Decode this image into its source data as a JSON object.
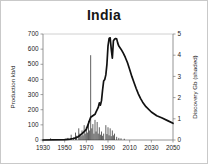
{
  "chart_data": {
    "type": "line",
    "title": "India",
    "xlabel": "",
    "ylabel": "Production kb/d",
    "y2label": "Discovery Gb (shaded)",
    "xlim": [
      1930,
      2050
    ],
    "ylim": [
      0,
      700
    ],
    "y2lim": [
      0,
      5
    ],
    "xticks": [
      1930,
      1950,
      1970,
      1990,
      2010,
      2030,
      2050
    ],
    "yticks": [
      0,
      100,
      200,
      300,
      400,
      500,
      600,
      700
    ],
    "y2ticks": [
      0,
      1,
      2,
      3,
      4,
      5
    ],
    "grid": false,
    "legend": "none",
    "series": [
      {
        "name": "Production kb/d",
        "axis": "left",
        "units": "kb/d",
        "x": [
          1930,
          1950,
          1955,
          1958,
          1960,
          1962,
          1964,
          1966,
          1968,
          1970,
          1972,
          1974,
          1976,
          1978,
          1979,
          1980,
          1981,
          1982,
          1983,
          1984,
          1985,
          1986,
          1987,
          1988,
          1989,
          1990,
          1991,
          1992,
          1993,
          1994,
          1995,
          1996,
          1997,
          1998,
          1999,
          2000,
          2002,
          2004,
          2006,
          2008,
          2010,
          2012,
          2014,
          2016,
          2018,
          2020,
          2022,
          2025,
          2030,
          2035,
          2040,
          2045,
          2050
        ],
        "y": [
          0,
          2,
          6,
          10,
          14,
          20,
          30,
          42,
          55,
          70,
          110,
          150,
          160,
          170,
          185,
          200,
          215,
          245,
          230,
          260,
          330,
          390,
          400,
          430,
          500,
          620,
          670,
          675,
          600,
          540,
          655,
          665,
          670,
          668,
          640,
          620,
          600,
          575,
          545,
          510,
          465,
          420,
          380,
          340,
          305,
          275,
          250,
          220,
          185,
          160,
          145,
          128,
          110
        ]
      },
      {
        "name": "Discovery Gb (shaded)",
        "axis": "right",
        "units": "Gb",
        "type": "bar",
        "x": [
          1937,
          1953,
          1956,
          1958,
          1960,
          1961,
          1963,
          1964,
          1965,
          1966,
          1967,
          1968,
          1969,
          1970,
          1971,
          1972,
          1973,
          1974,
          1975,
          1976,
          1977,
          1978,
          1979,
          1980,
          1981,
          1982,
          1983,
          1984,
          1985,
          1986,
          1988,
          1989,
          1990,
          1991,
          1992,
          1993,
          1994,
          1995,
          1996,
          1998,
          2000,
          2002,
          2005
        ],
        "y": [
          0.08,
          0.1,
          0.25,
          0.12,
          0.35,
          0.2,
          0.55,
          0.3,
          0.18,
          0.45,
          0.22,
          0.7,
          0.3,
          0.62,
          0.35,
          0.9,
          0.45,
          4.0,
          0.55,
          0.75,
          0.3,
          0.95,
          0.4,
          0.85,
          0.3,
          0.6,
          0.25,
          0.4,
          0.2,
          0.3,
          0.7,
          0.28,
          0.6,
          0.22,
          0.55,
          0.18,
          0.45,
          0.22,
          0.3,
          0.15,
          0.1,
          0.08,
          0.06
        ]
      }
    ]
  },
  "colors": {
    "curve": "#111111",
    "bars": "#1c1c1c",
    "axis": "#7a7a7a",
    "frame": "#c9c9c9",
    "text": "#1a1a1a",
    "background": "#ffffff"
  }
}
